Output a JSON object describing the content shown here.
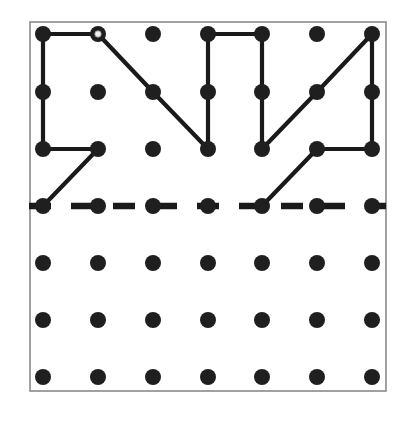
{
  "figure": {
    "title": "Geoboard dot grid with polyline figure and dashed fold line",
    "type": "dot-grid-diagram",
    "canvas": {
      "width": 408,
      "height": 425
    },
    "background_color": "#ffffff"
  },
  "frame": {
    "name": "board-border",
    "x": 30,
    "y": 22,
    "width": 356,
    "height": 369,
    "stroke_color": "#8a8a8a",
    "fill_color": "#ffffff",
    "stroke_width": 1.6
  },
  "grid": {
    "columns": 7,
    "rows": 7,
    "column_x": [
      43,
      98,
      153,
      208,
      262,
      317,
      372
    ],
    "row_y": [
      34,
      92,
      149,
      206,
      263,
      320,
      377
    ],
    "spacing_x": 54.8,
    "spacing_y": 57.2,
    "dot_radius": 8,
    "dot_color": "#1f1f1f"
  },
  "markers": {
    "open_dot": {
      "label": "start-vertex",
      "column": 1,
      "row": 0,
      "outer_radius": 8,
      "inner_radius": 3.2,
      "inner_fill": "#efefef",
      "inner_stroke": "#9a9a9a"
    }
  },
  "chart_data": {
    "type": "scatter",
    "title": "Geoboard dot grid with polyline figure and dashed fold line",
    "xlabel": "",
    "ylabel": "",
    "xlim": [
      0,
      6
    ],
    "ylim": [
      0,
      6
    ],
    "grid": false,
    "legend": "none",
    "dots": [
      {
        "col": 0,
        "row": 0
      },
      {
        "col": 1,
        "row": 0
      },
      {
        "col": 2,
        "row": 0
      },
      {
        "col": 3,
        "row": 0
      },
      {
        "col": 4,
        "row": 0
      },
      {
        "col": 5,
        "row": 0
      },
      {
        "col": 6,
        "row": 0
      },
      {
        "col": 0,
        "row": 1
      },
      {
        "col": 1,
        "row": 1
      },
      {
        "col": 2,
        "row": 1
      },
      {
        "col": 3,
        "row": 1
      },
      {
        "col": 4,
        "row": 1
      },
      {
        "col": 5,
        "row": 1
      },
      {
        "col": 6,
        "row": 1
      },
      {
        "col": 0,
        "row": 2
      },
      {
        "col": 1,
        "row": 2
      },
      {
        "col": 2,
        "row": 2
      },
      {
        "col": 3,
        "row": 2
      },
      {
        "col": 4,
        "row": 2
      },
      {
        "col": 5,
        "row": 2
      },
      {
        "col": 6,
        "row": 2
      },
      {
        "col": 0,
        "row": 3
      },
      {
        "col": 1,
        "row": 3
      },
      {
        "col": 2,
        "row": 3
      },
      {
        "col": 3,
        "row": 3
      },
      {
        "col": 4,
        "row": 3
      },
      {
        "col": 5,
        "row": 3
      },
      {
        "col": 6,
        "row": 3
      },
      {
        "col": 0,
        "row": 4
      },
      {
        "col": 1,
        "row": 4
      },
      {
        "col": 2,
        "row": 4
      },
      {
        "col": 3,
        "row": 4
      },
      {
        "col": 4,
        "row": 4
      },
      {
        "col": 5,
        "row": 4
      },
      {
        "col": 6,
        "row": 4
      },
      {
        "col": 0,
        "row": 5
      },
      {
        "col": 1,
        "row": 5
      },
      {
        "col": 2,
        "row": 5
      },
      {
        "col": 3,
        "row": 5
      },
      {
        "col": 4,
        "row": 5
      },
      {
        "col": 5,
        "row": 5
      },
      {
        "col": 6,
        "row": 5
      },
      {
        "col": 0,
        "row": 6
      },
      {
        "col": 1,
        "row": 6
      },
      {
        "col": 2,
        "row": 6
      },
      {
        "col": 3,
        "row": 6
      },
      {
        "col": 4,
        "row": 6
      },
      {
        "col": 5,
        "row": 6
      },
      {
        "col": 6,
        "row": 6
      }
    ],
    "polylines": [
      {
        "name": "zigzag-upper-path",
        "style": "solid",
        "stroke_color": "#1a1a1a",
        "stroke_width": 4.2,
        "vertices_colrow": [
          [
            1,
            0
          ],
          [
            0,
            0
          ],
          [
            0,
            1
          ],
          [
            0,
            2
          ],
          [
            1,
            2
          ],
          [
            0,
            3
          ]
        ]
      },
      {
        "name": "zigzag-main-path",
        "style": "solid",
        "stroke_color": "#1a1a1a",
        "stroke_width": 4.2,
        "vertices_colrow": [
          [
            1,
            0
          ],
          [
            2,
            1
          ],
          [
            3,
            2
          ],
          [
            3,
            1
          ],
          [
            3,
            0
          ],
          [
            4,
            0
          ],
          [
            4,
            1
          ],
          [
            4,
            2
          ],
          [
            5,
            1
          ],
          [
            6,
            0
          ],
          [
            6,
            1
          ],
          [
            6,
            2
          ],
          [
            5,
            2
          ],
          [
            4,
            3
          ]
        ]
      }
    ],
    "dashed_lines": [
      {
        "name": "fold-line",
        "style": "dashed",
        "stroke_color": "#1a1a1a",
        "stroke_width": 6.5,
        "dash_pattern": "22 20",
        "row": 3,
        "from_colrow": [
          0,
          3
        ],
        "to_colrow": [
          6,
          3
        ]
      }
    ]
  }
}
